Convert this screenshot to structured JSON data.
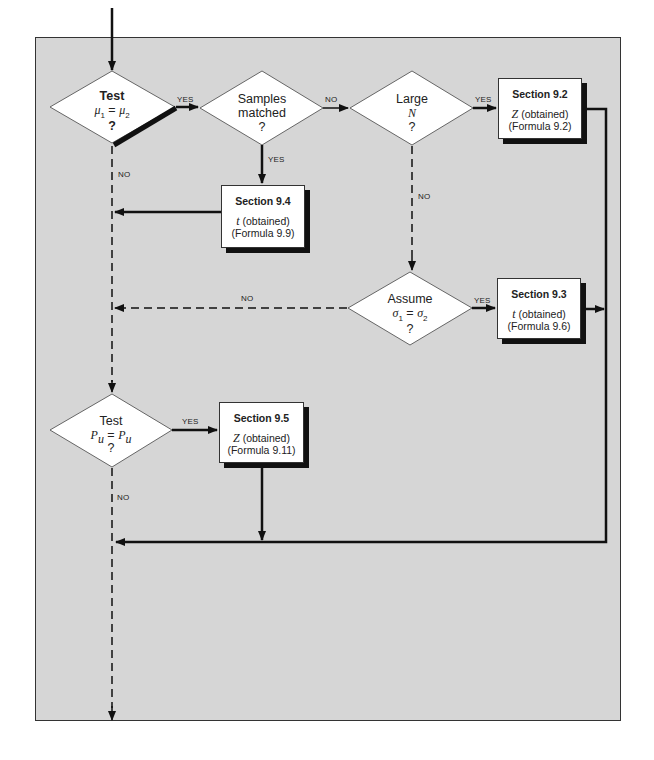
{
  "diagram": {
    "type": "flowchart",
    "nodes": {
      "d1": {
        "title": "Test",
        "expr_left": "μ",
        "sub_left": "1",
        "eq": " = ",
        "expr_right": "μ",
        "sub_right": "2",
        "q": "?"
      },
      "d2": {
        "line1": "Samples",
        "line2": "matched",
        "q": "?"
      },
      "d3": {
        "line1": "Large",
        "line2": "N",
        "q": "?"
      },
      "d4": {
        "line1": "Assume",
        "expr_left": "σ",
        "sub_left": "1",
        "eq": " = ",
        "expr_right": "σ",
        "sub_right": "2",
        "q": "?"
      },
      "d5": {
        "line1": "Test",
        "expr_left": "P",
        "sub_left": "u",
        "eq": " = ",
        "expr_right": "P",
        "sub_right": "u",
        "q": "?"
      },
      "s92": {
        "title": "Section 9.2",
        "stat": "Z",
        "stat_rest": " (obtained)",
        "formula": "(Formula 9.2)"
      },
      "s93": {
        "title": "Section 9.3",
        "stat": "t",
        "stat_rest": " (obtained)",
        "formula": "(Formula 9.6)"
      },
      "s94": {
        "title": "Section 9.4",
        "stat": "t",
        "stat_rest": " (obtained)",
        "formula": "(Formula 9.9)"
      },
      "s95": {
        "title": "Section 9.5",
        "stat": "Z",
        "stat_rest": " (obtained)",
        "formula": "(Formula 9.11)"
      }
    },
    "edge_labels": {
      "d1_yes": "YES",
      "d1_no": "NO",
      "d2_no": "NO",
      "d2_yes": "YES",
      "d3_yes": "YES",
      "d3_no": "NO",
      "d4_yes": "YES",
      "d4_no": "NO",
      "d5_yes": "YES",
      "d5_no": "NO"
    },
    "colors": {
      "panel_bg": "#d6d6d6",
      "line": "#111111",
      "box_bg": "#ffffff"
    }
  }
}
